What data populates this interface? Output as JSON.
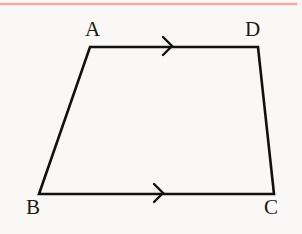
{
  "figure": {
    "kind": "geometry-diagram",
    "shape_name": "trapezoid",
    "canvas": {
      "width": 302,
      "height": 234
    },
    "background_color": "#faf8f6",
    "stroke_color": "#111111",
    "stroke_width": 2.6,
    "top_rule": {
      "name": "top-divider",
      "color": "#f0a9a0",
      "y": 4,
      "x_start": 0,
      "x_end": 297,
      "thickness": 2.4
    },
    "vertices": [
      {
        "id": "A",
        "label": "A",
        "x": 90,
        "y": 47,
        "label_x": 85,
        "label_y": 19
      },
      {
        "id": "D",
        "label": "D",
        "x": 258,
        "y": 47,
        "label_x": 245,
        "label_y": 19
      },
      {
        "id": "C",
        "label": "C",
        "x": 274,
        "y": 194,
        "label_x": 264,
        "label_y": 197
      },
      {
        "id": "B",
        "label": "B",
        "x": 39,
        "y": 194,
        "label_x": 26,
        "label_y": 197
      }
    ],
    "edges": [
      {
        "id": "AD",
        "from": "A",
        "to": "D",
        "parallel_marks": 1,
        "direction": "right"
      },
      {
        "id": "DC",
        "from": "D",
        "to": "C",
        "parallel_marks": 0,
        "direction": ""
      },
      {
        "id": "BC",
        "from": "B",
        "to": "C",
        "parallel_marks": 1,
        "direction": "right"
      },
      {
        "id": "BA",
        "from": "B",
        "to": "A",
        "parallel_marks": 0,
        "direction": ""
      }
    ],
    "arrow_markers": [
      {
        "id": "arrow-AD",
        "on_edge": "AD",
        "tip_x": 172,
        "tip_y": 46,
        "size": 9
      },
      {
        "id": "arrow-BC",
        "on_edge": "BC",
        "tip_x": 163,
        "tip_y": 193,
        "size": 9
      }
    ],
    "polygon_points": "90,47 258,47 274,194 39,194"
  }
}
